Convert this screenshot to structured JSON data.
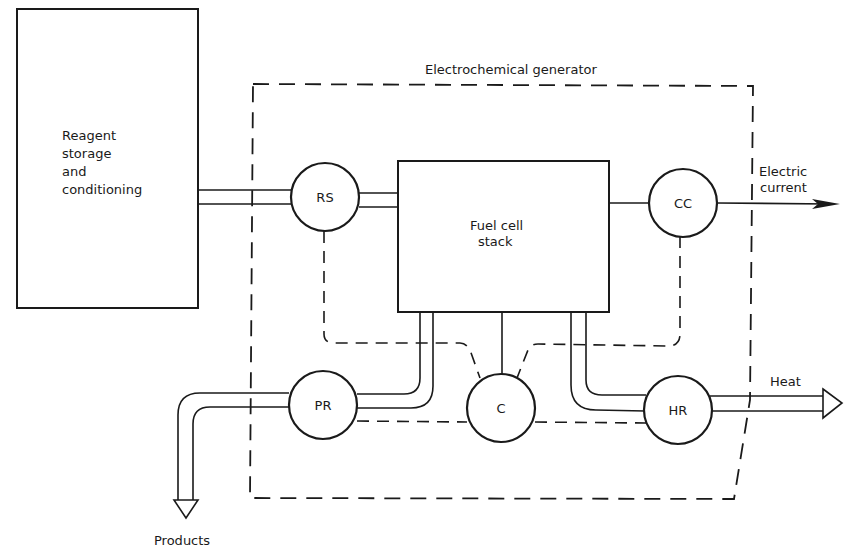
{
  "diagram": {
    "type": "block-diagram",
    "title": "Electrochemical generator",
    "colors": {
      "stroke": "#1a1a1a",
      "background": "#ffffff"
    },
    "blocks": {
      "reagent": {
        "lines": [
          "Reagent",
          "storage",
          "and",
          "conditioning"
        ]
      },
      "stack": {
        "lines": [
          "Fuel cell",
          "stack"
        ]
      }
    },
    "nodes": {
      "rs": "RS",
      "cc": "CC",
      "pr": "PR",
      "c": "C",
      "hr": "HR"
    },
    "outputs": {
      "electric": [
        "Electric",
        "current"
      ],
      "heat": "Heat",
      "products": "Products"
    },
    "connections": [
      {
        "from": "Reagent storage and conditioning",
        "to": "RS",
        "style": "double-pipe"
      },
      {
        "from": "RS",
        "to": "Fuel cell stack",
        "style": "double-pipe"
      },
      {
        "from": "Fuel cell stack",
        "to": "CC",
        "style": "wire"
      },
      {
        "from": "CC",
        "to": "Electric current",
        "style": "arrow"
      },
      {
        "from": "Fuel cell stack",
        "to": "PR",
        "style": "double-pipe"
      },
      {
        "from": "Fuel cell stack",
        "to": "C",
        "style": "wire"
      },
      {
        "from": "Fuel cell stack",
        "to": "HR",
        "style": "double-pipe"
      },
      {
        "from": "PR",
        "to": "Products",
        "style": "double-pipe-arrow"
      },
      {
        "from": "HR",
        "to": "Heat",
        "style": "double-pipe-arrow"
      },
      {
        "from": "C",
        "to": "RS",
        "style": "dashed-control"
      },
      {
        "from": "C",
        "to": "CC",
        "style": "dashed-control"
      },
      {
        "from": "C",
        "to": "PR",
        "style": "dashed-control"
      },
      {
        "from": "C",
        "to": "HR",
        "style": "dashed-control"
      }
    ]
  }
}
